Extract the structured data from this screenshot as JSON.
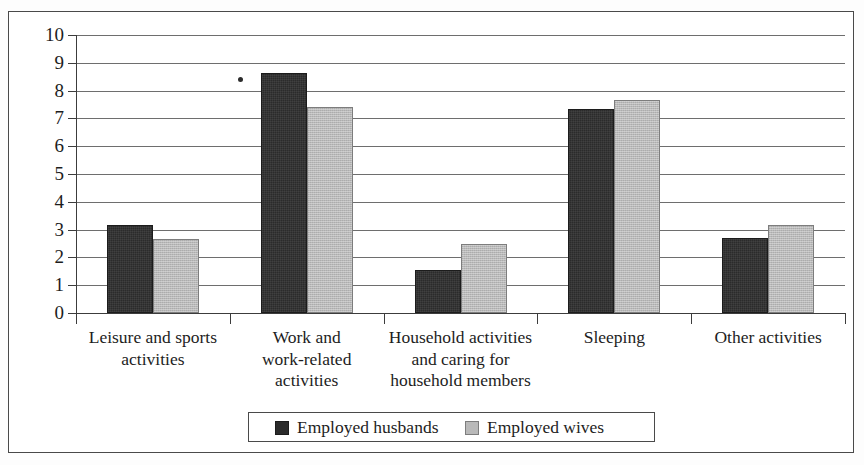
{
  "chart_data": {
    "type": "bar",
    "title": "",
    "subtitle": "",
    "xlabel": "",
    "ylabel": "",
    "ylim": [
      0,
      10
    ],
    "yticks": [
      0,
      1,
      2,
      3,
      4,
      5,
      6,
      7,
      8,
      9,
      10
    ],
    "ytick_labels": [
      "0",
      "1",
      "2",
      "3",
      "4",
      "5",
      "6",
      "7",
      "8",
      "9",
      "10"
    ],
    "grid": true,
    "legend_position": "bottom",
    "categories": [
      "Leisure and sports activities",
      "Work and work-related activities",
      "Household activities and caring for household members",
      "Sleeping",
      "Other activities"
    ],
    "category_label_lines": [
      [
        "Leisure and sports",
        "activities"
      ],
      [
        "Work and",
        "work-related",
        "activities"
      ],
      [
        "Household activities",
        "and caring for",
        "household members"
      ],
      [
        "Sleeping"
      ],
      [
        "Other activities"
      ]
    ],
    "series": [
      {
        "name": "Employed husbands",
        "color": "#2b2b2b",
        "values": [
          3.15,
          8.65,
          1.55,
          7.35,
          2.7
        ]
      },
      {
        "name": "Employed wives",
        "color": "#b9b9b9",
        "values": [
          2.65,
          7.4,
          2.5,
          7.65,
          3.15
        ]
      }
    ]
  },
  "legend": {
    "entries": [
      {
        "label": "Employed husbands",
        "swatch": "dark-swatch"
      },
      {
        "label": "Employed wives",
        "swatch": "light-swatch"
      }
    ]
  },
  "colors": {
    "series_dark": "#2b2b2b",
    "series_light": "#b9b9b9",
    "gridline": "#6e6e6e",
    "axis": "#3c3c3c",
    "frame": "#4a4a4a",
    "text": "#1d1d1d",
    "background": "#ffffff"
  }
}
